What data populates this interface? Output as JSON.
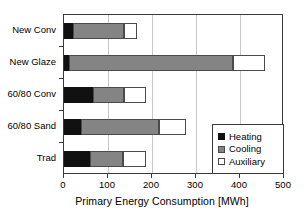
{
  "chart_data": {
    "type": "bar",
    "orientation": "horizontal",
    "stacked": true,
    "title": "",
    "xlabel": "Primary Energy Consumption [MWh]",
    "ylabel": "",
    "xlim": [
      0,
      500
    ],
    "xticks": [
      0,
      100,
      200,
      300,
      400,
      500
    ],
    "xtick_labels": [
      "0",
      "100",
      "200",
      "300",
      "400",
      "500"
    ],
    "grid": "vertical",
    "legend_position": "lower-right",
    "categories": [
      "New Conv",
      "New Glaze",
      "60/80 Conv",
      "60/80 Sand",
      "Trad"
    ],
    "series": [
      {
        "name": "Heating",
        "color": "#111111",
        "values": [
          20,
          12,
          66,
          39,
          60
        ]
      },
      {
        "name": "Cooling",
        "color": "#848484",
        "values": [
          116,
          372,
          70,
          177,
          74
        ]
      },
      {
        "name": "Auxiliary",
        "color": "#ffffff",
        "values": [
          31,
          73,
          50,
          61,
          52
        ]
      }
    ],
    "totals": [
      167,
      457,
      186,
      277,
      186
    ]
  },
  "axis": {
    "x_title": "Primary Energy Consumption [MWh]"
  },
  "legend": {
    "entries": [
      {
        "label": "Heating",
        "swatch": "black-square-icon"
      },
      {
        "label": "Cooling",
        "swatch": "gray-square-icon"
      },
      {
        "label": "Auxiliary",
        "swatch": "white-square-icon"
      }
    ]
  }
}
